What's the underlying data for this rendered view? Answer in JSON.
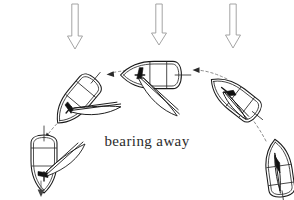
{
  "figure": {
    "caption": "bearing away",
    "background_color": "#ffffff",
    "ink_color": "#1a1a1a",
    "track_color": "#8d8d8d",
    "wind_arrow_color": "#9a9a9a"
  },
  "wind": {
    "label": "wind-direction-arrows",
    "direction": "downward",
    "count": 3,
    "arrows": [
      {
        "name": "wind-arrow-left",
        "x": 75,
        "y_top": 4,
        "y_tip": 49,
        "shaft_half_width": 3.2,
        "head_half_width": 7.5,
        "head_height": 13
      },
      {
        "name": "wind-arrow-center",
        "x": 159,
        "y_top": 4,
        "y_tip": 45,
        "shaft_half_width": 3.2,
        "head_half_width": 7.5,
        "head_height": 13
      },
      {
        "name": "wind-arrow-right",
        "x": 233,
        "y_top": 4,
        "y_tip": 48,
        "shaft_half_width": 3.2,
        "head_half_width": 7.5,
        "head_height": 13
      }
    ]
  },
  "boats": [
    {
      "name": "boat-position-1-close-hauled",
      "order": 1,
      "center_x": 279,
      "center_y": 169,
      "rotation_deg": -8,
      "heading": "upwind",
      "sail_state": "sheeted-in",
      "scale": 1.0
    },
    {
      "name": "boat-position-2-luffing-turn",
      "order": 2,
      "center_x": 235,
      "center_y": 98,
      "rotation_deg": -52,
      "heading": "turning-away",
      "sail_state": "sheeted-in",
      "scale": 1.0
    },
    {
      "name": "boat-position-3-beam-reach",
      "order": 3,
      "center_x": 152,
      "center_y": 75,
      "rotation_deg": -90,
      "heading": "across-wind",
      "sail_state": "eased",
      "scale": 1.05
    },
    {
      "name": "boat-position-4-broad-reach",
      "order": 4,
      "center_x": 77,
      "center_y": 100,
      "rotation_deg": -140,
      "heading": "bearing-away",
      "sail_state": "eased",
      "scale": 1.0
    },
    {
      "name": "boat-position-5-running",
      "order": 5,
      "center_x": 44,
      "center_y": 163,
      "rotation_deg": -180,
      "heading": "downwind",
      "sail_state": "fully-out",
      "scale": 1.0
    }
  ],
  "track": {
    "name": "boat-track-arc",
    "style": "dashed",
    "description": "curved dashed path from the close-hauled boat around to the running boat",
    "segments": [
      {
        "name": "track-segment-right",
        "d": "M 266 140 C 256 122 248 112 241 106",
        "head_x": 240,
        "head_y": 104,
        "head_angle_deg": -130
      },
      {
        "name": "track-segment-upper-right",
        "d": "M 226 80 C 214 74 204 71 195 70",
        "head_x": 193,
        "head_y": 70,
        "head_angle_deg": 180
      },
      {
        "name": "track-segment-upper-left",
        "d": "M 130 71 C 121 71 114 72 109 74",
        "head_x": 107,
        "head_y": 74,
        "head_angle_deg": 175
      },
      {
        "name": "track-segment-left",
        "d": "M 63 118 C 56 124 50 131 45 138",
        "head_x": 44,
        "head_y": 140,
        "head_angle_deg": 130
      }
    ]
  },
  "course_marker": {
    "name": "downwind-heading-arrow",
    "x": 41,
    "y_start": 181,
    "y_end": 196
  },
  "caption_position": {
    "x": 147,
    "y": 146
  }
}
